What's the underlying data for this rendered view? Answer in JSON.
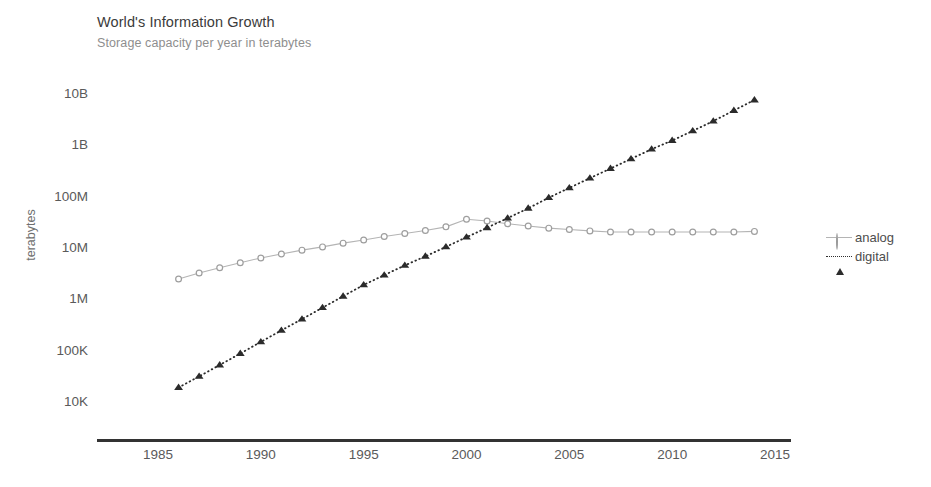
{
  "header": {
    "title": "World's Information Growth",
    "subtitle": "Storage capacity per year in terabytes"
  },
  "axes": {
    "ylabel": "terabytes",
    "y_ticks": [
      "10B",
      "1B",
      "100M",
      "10M",
      "1M",
      "100K",
      "10K"
    ],
    "x_ticks": [
      "1985",
      "1990",
      "1995",
      "2000",
      "2005",
      "2010",
      "2015"
    ]
  },
  "legend": {
    "position": "right",
    "entries": [
      {
        "label": "analog",
        "marker": "circle-marker",
        "line": "solid",
        "color": "#b4b4b4"
      },
      {
        "label": "digital",
        "marker": "triangle-marker",
        "line": "dotted",
        "color": "#2b2b2b"
      }
    ]
  },
  "chart_data": {
    "type": "line",
    "title": "World's Information Growth",
    "subtitle": "Storage capacity per year in terabytes",
    "xlabel": "",
    "ylabel": "terabytes",
    "yscale": "log",
    "ylim": [
      10000,
      10000000000
    ],
    "xlim": [
      1985,
      2015
    ],
    "grid": false,
    "y_tick_values": [
      10000000000,
      1000000000,
      100000000,
      10000000,
      1000000,
      100000,
      10000
    ],
    "y_tick_labels": [
      "10B",
      "1B",
      "100M",
      "10M",
      "1M",
      "100K",
      "10K"
    ],
    "x_tick_values": [
      1985,
      1990,
      1995,
      2000,
      2005,
      2010,
      2015
    ],
    "x_tick_labels": [
      "1985",
      "1990",
      "1995",
      "2000",
      "2005",
      "2010",
      "2015"
    ],
    "x": [
      1986,
      1987,
      1988,
      1989,
      1990,
      1991,
      1992,
      1993,
      1994,
      1995,
      1996,
      1997,
      1998,
      1999,
      2000,
      2001,
      2002,
      2003,
      2004,
      2005,
      2006,
      2007,
      2008,
      2009,
      2010,
      2011,
      2012,
      2013,
      2014
    ],
    "series": [
      {
        "name": "analog",
        "color": "#b4b4b4",
        "marker": "circle",
        "linestyle": "solid",
        "values": [
          2600000,
          3400000,
          4300000,
          5400000,
          6700000,
          8000000,
          9500000,
          11000000,
          13000000,
          15000000,
          17500000,
          20000000,
          23000000,
          27000000,
          38000000,
          35000000,
          31000000,
          28000000,
          25500000,
          24000000,
          22500000,
          21500000,
          21500000,
          21500000,
          21500000,
          21500000,
          21500000,
          21500000,
          22000000
        ]
      },
      {
        "name": "digital",
        "color": "#2b2b2b",
        "marker": "triangle",
        "linestyle": "dotted",
        "values": [
          20000,
          33000,
          55000,
          92000,
          155000,
          260000,
          430000,
          720000,
          1200000,
          2000000,
          3100000,
          4800000,
          7200000,
          11000000,
          17000000,
          26000000,
          40000000,
          62000000,
          100000000,
          155000000,
          240000000,
          370000000,
          570000000,
          880000000,
          1300000000,
          2000000000,
          3100000000,
          5000000000,
          8000000000
        ]
      }
    ]
  }
}
